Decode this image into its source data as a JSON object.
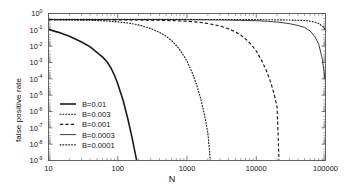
{
  "chart_data": {
    "type": "line",
    "title": "",
    "xlabel": "N",
    "ylabel": "false positive rate",
    "xscale": "log",
    "yscale": "log",
    "xlim": [
      10,
      100000
    ],
    "ylim": [
      1e-09,
      1
    ],
    "grid": false,
    "legend_position": "lower left",
    "xticks": [
      10,
      100,
      1000,
      10000,
      100000
    ],
    "xtick_labels": [
      "10",
      "100",
      "1000",
      "10000",
      "100000"
    ],
    "yticks": [
      1,
      0.1,
      0.01,
      0.001,
      0.0001,
      1e-05,
      1e-06,
      1e-07,
      1e-08,
      1e-09
    ],
    "ytick_labels": [
      "10^0",
      "10^-1",
      "10^-2",
      "10^-3",
      "10^-4",
      "10^-5",
      "10^-6",
      "10^-7",
      "10^-8",
      "10^-9"
    ],
    "ytick_mantissa": "10",
    "ytick_exponents": [
      "0",
      "-1",
      "-2",
      "-3",
      "-4",
      "-5",
      "-6",
      "-7",
      "-8",
      "-9"
    ],
    "series": [
      {
        "name": "B=0.01",
        "label": "B=0.01",
        "style": "solid-thick",
        "color": "#1a1a1a",
        "x": [
          10,
          14,
          20,
          30,
          40,
          50,
          60,
          70,
          80,
          90,
          100,
          120,
          140,
          160,
          180,
          200,
          215,
          225
        ],
        "y": [
          0.105,
          0.07,
          0.04,
          0.018,
          0.009,
          0.0042,
          0.0022,
          0.0011,
          0.00045,
          0.00016,
          5e-05,
          4.5e-06,
          3.5e-07,
          2.8e-08,
          2.4e-09,
          2.5e-10,
          4.05e-11,
          6.5e-12
        ]
      },
      {
        "name": "B=0.003",
        "label": "B=0.003",
        "style": "dotted-fine",
        "color": "#1a1a1a",
        "x": [
          10,
          20,
          40,
          70,
          100,
          150,
          200,
          300,
          400,
          500,
          600,
          700,
          800,
          900,
          1000,
          1200,
          1400,
          1600,
          1800,
          2000,
          2150,
          2250
        ],
        "y": [
          0.41,
          0.4,
          0.385,
          0.35,
          0.31,
          0.25,
          0.2,
          0.12,
          0.07,
          0.04,
          0.022,
          0.011,
          0.0055,
          0.0026,
          0.0012,
          0.00022,
          3.5e-05,
          4.8e-06,
          5.5e-07,
          5e-08,
          1.7e-09,
          1.2e-10
        ]
      },
      {
        "name": "B=0.001",
        "label": "B=0.001",
        "style": "dashed",
        "color": "#1a1a1a",
        "x": [
          10,
          30,
          100,
          200,
          400,
          700,
          1000,
          1500,
          2000,
          3000,
          4000,
          5000,
          6000,
          7000,
          8000,
          9000,
          10000,
          12000,
          14000,
          16000,
          18000,
          20000,
          21500
        ],
        "y": [
          0.42,
          0.418,
          0.41,
          0.4,
          0.385,
          0.36,
          0.335,
          0.29,
          0.245,
          0.17,
          0.115,
          0.075,
          0.047,
          0.028,
          0.016,
          0.009,
          0.005,
          0.0013,
          0.00032,
          7e-05,
          1.3e-05,
          1.9e-06,
          3.5e-10
        ]
      },
      {
        "name": "B=0.0003",
        "label": "B=0.0003",
        "style": "solid-thin",
        "color": "#1a1a1a",
        "x": [
          10,
          100,
          500,
          1000,
          2000,
          4000,
          7000,
          10000,
          15000,
          20000,
          30000,
          40000,
          50000,
          60000,
          70000,
          80000,
          90000,
          100000
        ],
        "y": [
          0.43,
          0.425,
          0.42,
          0.415,
          0.408,
          0.395,
          0.375,
          0.36,
          0.33,
          0.3,
          0.24,
          0.185,
          0.14,
          0.085,
          0.04,
          0.013,
          0.0016,
          6e-05
        ]
      },
      {
        "name": "B=0.0001",
        "label": "B=0.0001",
        "style": "dotted-fine",
        "color": "#1a1a1a",
        "x": [
          10,
          100,
          1000,
          5000,
          10000,
          20000,
          30000,
          40000,
          50000,
          60000,
          70000,
          80000,
          90000,
          100000
        ],
        "y": [
          0.44,
          0.438,
          0.432,
          0.425,
          0.42,
          0.41,
          0.4,
          0.385,
          0.37,
          0.34,
          0.3,
          0.24,
          0.17,
          0.105
        ]
      }
    ],
    "legend": [
      {
        "label": "B=0.01",
        "style": "solid-thick"
      },
      {
        "label": "B=0.003",
        "style": "dotted-fine"
      },
      {
        "label": "B=0.001",
        "style": "dashed"
      },
      {
        "label": "B=0.0003",
        "style": "solid-thin"
      },
      {
        "label": "B=0.0001",
        "style": "dotted-fine"
      }
    ]
  }
}
